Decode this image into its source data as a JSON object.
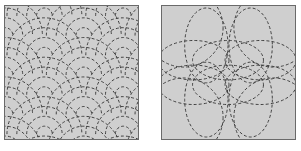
{
  "figure": {
    "panels": [
      {
        "id": "left",
        "name": "seigaiha-wave-pattern",
        "description": "Overlapping concentric dashed semicircular arcs (wave scale pattern)",
        "rings_per_scale": 4,
        "colors": {
          "background": "#cfcfcf",
          "stroke": "#3e3e3e",
          "border": "#6a6a6a"
        }
      },
      {
        "id": "right",
        "name": "overlapping-circles-pattern",
        "description": "Overlapping dashed ellipses forming a flower-like lattice",
        "colors": {
          "background": "#cfcfcf",
          "stroke": "#3e3e3e",
          "border": "#6a6a6a"
        }
      }
    ]
  }
}
